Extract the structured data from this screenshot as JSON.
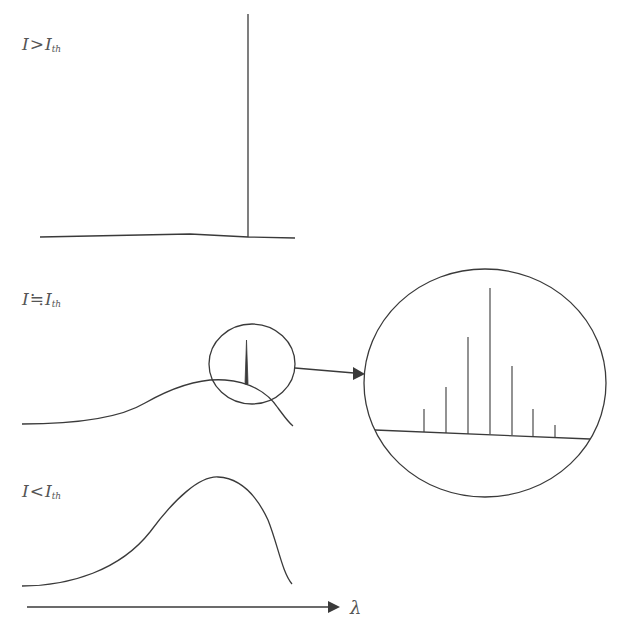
{
  "panels": [
    {
      "id": "above-threshold",
      "label_main": "I",
      "label_relation": ">",
      "label_var": "I",
      "label_sub": "th",
      "description": "Single narrow laser line"
    },
    {
      "id": "near-threshold",
      "label_main": "I",
      "label_relation": "≒",
      "label_var": "I",
      "label_sub": "th",
      "description": "Broad spectrum with emerging spike; magnified inset shows multiple longitudinal modes"
    },
    {
      "id": "below-threshold",
      "label_main": "I",
      "label_relation": "<",
      "label_var": "I",
      "label_sub": "th",
      "description": "Broad spontaneous emission spectrum"
    }
  ],
  "inset": {
    "mode_count": 7,
    "mode_heights_relative": [
      0.16,
      0.31,
      0.66,
      1.0,
      0.47,
      0.18,
      0.07
    ]
  },
  "axis": {
    "label": "λ"
  },
  "colors": {
    "stroke": "#3a3a3a",
    "text": "#555555",
    "background": "#ffffff"
  }
}
